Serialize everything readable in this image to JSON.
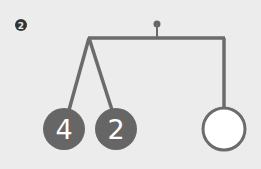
{
  "step_label": "2",
  "mobile": {
    "left_weights": [
      "4",
      "2"
    ],
    "right_weight": "",
    "colors": {
      "stroke": "#6b6b6b",
      "fill_dark": "#666666",
      "fill_light": "#ffffff",
      "background": "#ececec"
    }
  }
}
